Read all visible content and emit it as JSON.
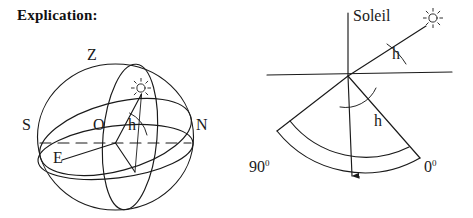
{
  "document": {
    "heading": "Explication:"
  },
  "figure_left": {
    "name": "celestial-sphere-diagram",
    "labels": {
      "zenith": "Z",
      "south": "S",
      "north": "N",
      "observer": "O",
      "east": "E",
      "altitude_angle": "h"
    },
    "icons": {
      "sun": "sun-icon"
    }
  },
  "figure_right": {
    "name": "quadrant-instrument-diagram",
    "labels": {
      "sun": "Soleil",
      "altitude_angle_upper": "h",
      "altitude_angle_lower": "h",
      "scale_max": "90",
      "scale_max_unit": "0",
      "scale_min": "0",
      "scale_min_unit": "0"
    },
    "icons": {
      "sun": "sun-icon",
      "plumb_arrow": "down-arrow-icon"
    }
  },
  "colors": {
    "ink": "#1a1a1a",
    "background": "#ffffff"
  }
}
